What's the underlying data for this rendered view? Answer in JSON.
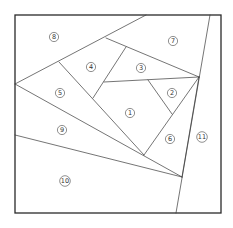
{
  "diagram": {
    "type": "quilt-piecing-pattern",
    "frame": {
      "x": 15,
      "y": 15,
      "width": 206,
      "height": 198
    },
    "stroke_color": "#3a3a3a",
    "segments": [
      {
        "id": "diag-8",
        "x1": 15,
        "y1": 84,
        "x2": 146,
        "y2": 15
      },
      {
        "id": "line-11",
        "x1": 210,
        "y1": 15,
        "x2": 176,
        "y2": 213
      },
      {
        "id": "edge-7-3",
        "x1": 106,
        "y1": 38,
        "x2": 199,
        "y2": 77
      },
      {
        "id": "edge-4-5",
        "x1": 59,
        "y1": 62,
        "x2": 144,
        "y2": 155
      },
      {
        "id": "edge-3-4",
        "x1": 126,
        "y1": 47,
        "x2": 93,
        "y2": 98
      },
      {
        "id": "edge-3-1",
        "x1": 104,
        "y1": 82,
        "x2": 199,
        "y2": 77
      },
      {
        "id": "edge-2-1",
        "x1": 148,
        "y1": 80,
        "x2": 172,
        "y2": 114
      },
      {
        "id": "edge-2-6",
        "x1": 199,
        "y1": 77,
        "x2": 144,
        "y2": 155
      },
      {
        "id": "edge-5-9",
        "x1": 15,
        "y1": 84,
        "x2": 182,
        "y2": 177
      },
      {
        "id": "edge-9-10",
        "x1": 15,
        "y1": 135,
        "x2": 182,
        "y2": 177
      },
      {
        "id": "edge-6-11",
        "x1": 199,
        "y1": 77,
        "x2": 182,
        "y2": 177
      }
    ],
    "labels": [
      {
        "text": "1",
        "x": 130,
        "y": 113
      },
      {
        "text": "2",
        "x": 172,
        "y": 93
      },
      {
        "text": "3",
        "x": 141,
        "y": 68
      },
      {
        "text": "4",
        "x": 91,
        "y": 67
      },
      {
        "text": "5",
        "x": 60,
        "y": 93
      },
      {
        "text": "6",
        "x": 170,
        "y": 139
      },
      {
        "text": "7",
        "x": 173,
        "y": 41
      },
      {
        "text": "8",
        "x": 54,
        "y": 37
      },
      {
        "text": "9",
        "x": 62,
        "y": 130
      },
      {
        "text": "10",
        "x": 65,
        "y": 181
      },
      {
        "text": "11",
        "x": 202,
        "y": 137
      }
    ]
  }
}
